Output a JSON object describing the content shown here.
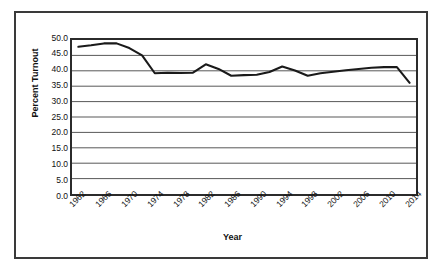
{
  "chart_data": {
    "type": "line",
    "title": "",
    "xlabel": "Year",
    "ylabel": "Percent Turnout",
    "ylim": [
      0.0,
      50.0
    ],
    "ytick_step": 5.0,
    "yticks": [
      "0.0",
      "5.0",
      "10.0",
      "15.0",
      "20.0",
      "25.0",
      "30.0",
      "35.0",
      "40.0",
      "45.0",
      "50.0"
    ],
    "ytick_values": [
      0.0,
      5.0,
      10.0,
      15.0,
      20.0,
      25.0,
      30.0,
      35.0,
      40.0,
      45.0,
      50.0
    ],
    "grid": "horizontal",
    "legend": "none",
    "xtick_labels": [
      "1962",
      "1966",
      "1970",
      "1974",
      "1978",
      "1982",
      "1986",
      "1990",
      "1994",
      "1998",
      "2002",
      "2006",
      "2010",
      "2014"
    ],
    "xtick_label_rotation": -45,
    "xtick_interval_years": 4,
    "x": [
      1962,
      1964,
      1966,
      1968,
      1970,
      1972,
      1974,
      1976,
      1978,
      1980,
      1982,
      1984,
      1986,
      1988,
      1990,
      1992,
      1994,
      1996,
      1998,
      2000,
      2002,
      2004,
      2006,
      2008,
      2010,
      2012,
      2014
    ],
    "values": [
      47.8,
      48.3,
      48.9,
      48.9,
      47.4,
      45.0,
      39.2,
      39.4,
      39.3,
      39.4,
      42.1,
      40.6,
      38.4,
      38.6,
      38.7,
      39.6,
      41.4,
      40.1,
      38.4,
      39.2,
      39.7,
      40.2,
      40.6,
      41.0,
      41.2,
      41.2,
      36.1
    ],
    "series": [
      {
        "name": "Percent Turnout",
        "color": "#1a1a1a",
        "values": [
          47.8,
          48.3,
          48.9,
          48.9,
          47.4,
          45.0,
          39.2,
          39.4,
          39.3,
          39.4,
          42.1,
          40.6,
          38.4,
          38.6,
          38.7,
          39.6,
          41.4,
          40.1,
          38.4,
          39.2,
          39.7,
          40.2,
          40.6,
          41.0,
          41.2,
          41.2,
          36.1
        ]
      }
    ],
    "colors": {
      "line": "#1a1a1a",
      "gridline": "#555555",
      "plot_border": "#2b2b2b",
      "outer_border": "#3a3a3a",
      "background": "#ffffff",
      "text": "#111111"
    }
  }
}
